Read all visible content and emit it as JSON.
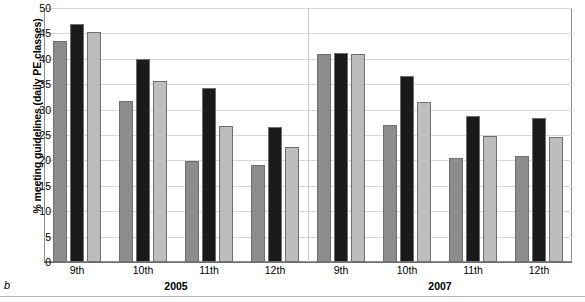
{
  "figure": {
    "letter": "b"
  },
  "chart_data": {
    "type": "bar",
    "title": "",
    "xlabel": "",
    "ylabel": "% meeting guidelines (daily PE classes)",
    "ylim": [
      0,
      50
    ],
    "yticks": [
      0,
      5,
      10,
      15,
      20,
      25,
      30,
      35,
      40,
      45,
      50
    ],
    "grid": true,
    "legend": "none",
    "panels": [
      {
        "name": "2005",
        "categories": [
          "9th",
          "10th",
          "11th",
          "12th"
        ]
      },
      {
        "name": "2007",
        "categories": [
          "9th",
          "10th",
          "11th",
          "12th"
        ]
      }
    ],
    "categories": [
      "9th 2005",
      "10th 2005",
      "11th 2005",
      "12th 2005",
      "9th 2007",
      "10th 2007",
      "11th 2007",
      "12th 2007"
    ],
    "series": [
      {
        "name": "series-1",
        "color": "#8c8c8c",
        "values": [
          43.6,
          31.6,
          19.8,
          19.1,
          41.0,
          27.0,
          20.4,
          20.8
        ]
      },
      {
        "name": "series-2",
        "color": "#1a1a1a",
        "values": [
          46.9,
          40.0,
          34.2,
          26.6,
          41.2,
          36.6,
          28.7,
          28.4
        ]
      },
      {
        "name": "series-3",
        "color": "#bdbdbd",
        "values": [
          45.2,
          35.6,
          26.8,
          22.7,
          41.0,
          31.5,
          24.9,
          24.7
        ]
      }
    ]
  }
}
